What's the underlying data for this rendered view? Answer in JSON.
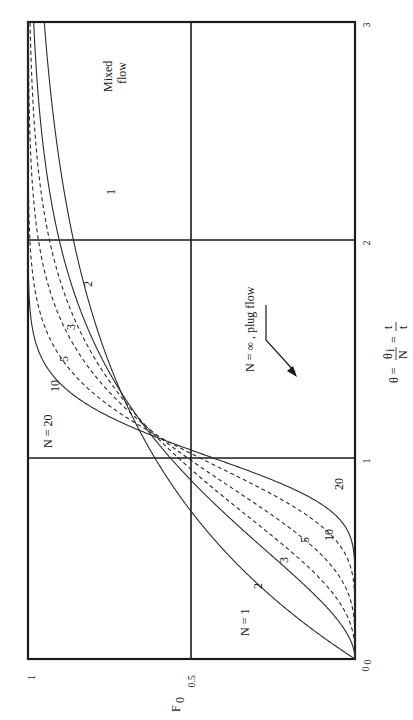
{
  "chart_data": {
    "type": "line",
    "title": "",
    "orientation": "rotated 90° counter-clockwise (F0 axis along bottom edge, θ axis along right edge)",
    "xlabel": "θ = θi/N = t/t̄",
    "ylabel": "F0",
    "xlim": [
      0,
      3
    ],
    "ylim": [
      0,
      1
    ],
    "x_ticks": [
      "0",
      "1",
      "2",
      "3"
    ],
    "y_ticks": [
      "0",
      "0.5",
      "1"
    ],
    "grid": {
      "x": [
        1,
        2
      ],
      "y": [
        0.5
      ]
    },
    "x": [
      0,
      0.25,
      0.5,
      0.75,
      1.0,
      1.25,
      1.5,
      2.0,
      2.5,
      3.0
    ],
    "series": [
      {
        "name": "N = 1",
        "label": "N = 1",
        "style": "solid",
        "N": 1,
        "values": [
          0,
          0.22,
          0.39,
          0.53,
          0.63,
          0.71,
          0.78,
          0.86,
          0.92,
          0.95
        ]
      },
      {
        "name": "N = 2",
        "label": "2",
        "style": "solid",
        "N": 2,
        "values": [
          0,
          0.09,
          0.26,
          0.44,
          0.59,
          0.71,
          0.8,
          0.91,
          0.96,
          0.98
        ]
      },
      {
        "name": "N = 3",
        "label": "3",
        "style": "dashed",
        "N": 3,
        "values": [
          0,
          0.04,
          0.19,
          0.39,
          0.58,
          0.72,
          0.83,
          0.94,
          0.98,
          0.99
        ]
      },
      {
        "name": "N = 5",
        "label": "5",
        "style": "dashed",
        "N": 5,
        "values": [
          0,
          0.01,
          0.11,
          0.32,
          0.56,
          0.75,
          0.87,
          0.97,
          0.99,
          1.0
        ]
      },
      {
        "name": "N = 10",
        "label": "10",
        "style": "dashed",
        "N": 10,
        "values": [
          0,
          0.0,
          0.03,
          0.22,
          0.54,
          0.79,
          0.93,
          0.99,
          1.0,
          1.0
        ]
      },
      {
        "name": "N = 20",
        "label": "N = 20",
        "style": "solid",
        "N": 20,
        "values": [
          0,
          0.0,
          0.0,
          0.13,
          0.53,
          0.86,
          0.98,
          1.0,
          1.0,
          1.0
        ]
      }
    ],
    "annotations": [
      {
        "text": "N = ∞ , plug flow",
        "points_to": {
          "x": 1,
          "y": 0.2
        }
      },
      {
        "text": "Mixed flow",
        "near_series": "N = 1"
      },
      {
        "text": "1",
        "near_series": "N = 1"
      },
      {
        "text": "2",
        "near_series": "N = 2"
      },
      {
        "text": "3",
        "near_series": "N = 3"
      },
      {
        "text": "5",
        "near_series": "N = 5"
      },
      {
        "text": "10",
        "near_series": "N = 10"
      },
      {
        "text": "20",
        "near_series": "N = 20"
      }
    ]
  },
  "labels": {
    "f_axis": "F",
    "f_axis_sub": "0",
    "f_tick_0": "0",
    "f_tick_half": "0.5",
    "f_tick_1": "1",
    "theta_tick_0": "0",
    "theta_tick_1": "1",
    "theta_tick_2": "2",
    "theta_tick_3": "3",
    "theta_axis": "θ = θi/N = t/t̄",
    "plug_flow": "N = ∞ , plug flow",
    "mixed": "Mixed",
    "flow": "flow",
    "lo_n1": "N = 1",
    "lo_2": "2",
    "lo_3": "3",
    "lo_5": "5",
    "lo_10": "10",
    "lo_20": "20",
    "hi_n20": "N = 20",
    "hi_10": "10",
    "hi_5": "5",
    "hi_3": "3",
    "hi_2": "2",
    "hi_1": "1"
  }
}
